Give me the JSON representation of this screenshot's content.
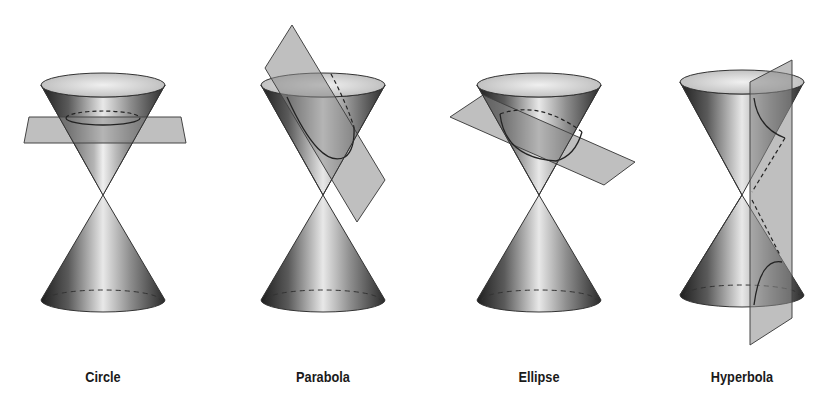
{
  "panels": [
    {
      "id": "circle",
      "label": "Circle",
      "plane": "horizontal plane cutting upper nappe"
    },
    {
      "id": "parabola",
      "label": "Parabola",
      "plane": "plane parallel to cone side"
    },
    {
      "id": "ellipse",
      "label": "Ellipse",
      "plane": "tilted plane cutting upper nappe"
    },
    {
      "id": "hyperbola",
      "label": "Hyperbola",
      "plane": "vertical plane cutting both nappes"
    }
  ],
  "colors": {
    "background": "#ffffff",
    "cone_dark": "#2e2e2e",
    "cone_light": "#e6e6e6",
    "plane_fill": "#8a8a8a",
    "outline": "#333333",
    "label": "#1a1a1a"
  }
}
